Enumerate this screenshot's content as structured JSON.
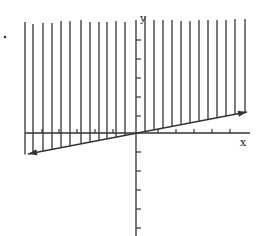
{
  "diagram": {
    "type": "vector-field-graph",
    "axes": {
      "x_label": "x",
      "y_label": "y",
      "origin": [
        136,
        133
      ],
      "x_axis": {
        "from": 25,
        "to": 250,
        "ticks_right": [
          158,
          176,
          194,
          212,
          230
        ],
        "ticks_left": [
          42,
          59,
          77,
          95,
          113
        ]
      },
      "y_axis": {
        "from": 20,
        "to": 236,
        "ticks_up": [
          40,
          59,
          78,
          97,
          116
        ],
        "ticks_down": [
          152,
          171,
          190,
          209,
          228
        ]
      }
    },
    "line": {
      "description": "slanted line through origin with arrowheads at both ends",
      "start": [
        28,
        154
      ],
      "end": [
        247,
        112
      ]
    },
    "vertical_lines": {
      "x_positions": [
        25,
        33,
        43,
        52,
        61,
        70,
        81,
        90,
        99,
        107,
        116,
        125,
        145,
        154,
        163,
        172,
        181,
        190,
        199,
        208,
        217,
        226,
        235,
        245
      ],
      "top_y": [
        22,
        24,
        23,
        23,
        21,
        21,
        20,
        22,
        22,
        22,
        21,
        22,
        17,
        20,
        20,
        20,
        21,
        21,
        20,
        20,
        20,
        20,
        19,
        19
      ]
    },
    "dot": [
      5,
      37
    ],
    "stroke_color": "#333333"
  }
}
